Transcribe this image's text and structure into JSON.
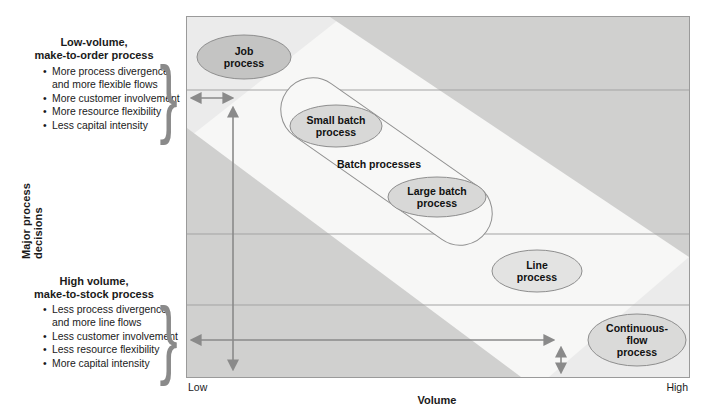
{
  "figure": {
    "y_axis_label": "Major process decisions",
    "x_axis": {
      "label": "Volume",
      "min_label": "Low",
      "max_label": "High"
    },
    "left_top": {
      "title": "Low-volume,\nmake-to-order process",
      "bullets": [
        "More process divergence\nand more flexible flows",
        "More customer involvement",
        "More resource flexibility",
        "Less capital intensity"
      ],
      "brace": "}"
    },
    "left_bottom": {
      "title": "High volume,\nmake-to-stock process",
      "bullets": [
        "Less process divergence\nand more line flows",
        "Less customer involvement",
        "Less resource flexibility",
        "More capital intensity"
      ],
      "brace": "}"
    },
    "batch_group_label": "Batch processes",
    "processes": [
      {
        "name": "Job process",
        "label": "Job\nprocess"
      },
      {
        "name": "Small batch process",
        "label": "Small batch\nprocess"
      },
      {
        "name": "Large batch process",
        "label": "Large batch\nprocess"
      },
      {
        "name": "Line process",
        "label": "Line\nprocess"
      },
      {
        "name": "Continuous-flow process",
        "label": "Continuous-\nflow process"
      }
    ],
    "colors": {
      "band_white": "#f7f7f6",
      "corner_gray": "#d0d0cf",
      "end_cap_gray": "#ebebeb",
      "job_ellipse_fill": "#c4c4c3",
      "batch_ellipse_fill": "#d8d8d7",
      "line_ellipse_fill": "#e3e3e2",
      "continuous_ellipse_fill": "#dadad9",
      "stroke_gray": "#8a8a8a",
      "grid_line": "#a3a3a3"
    }
  }
}
